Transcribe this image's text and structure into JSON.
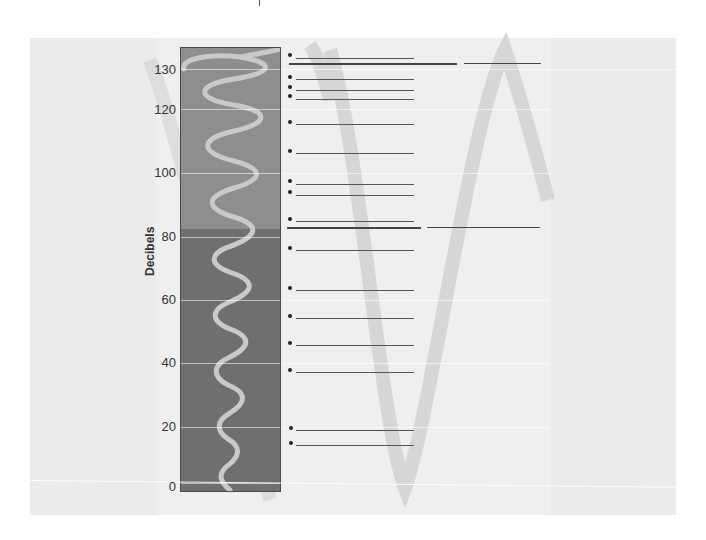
{
  "diagram": {
    "axis_title": "Decibels",
    "ticks": [
      {
        "label": "130",
        "y": 70
      },
      {
        "label": "120",
        "y": 110
      },
      {
        "label": "100",
        "y": 173
      },
      {
        "label": "80",
        "y": 237
      },
      {
        "label": "60",
        "y": 300
      },
      {
        "label": "40",
        "y": 363
      },
      {
        "label": "20",
        "y": 427
      },
      {
        "label": "0",
        "y": 487
      }
    ],
    "colors": {
      "panel": "#ebebeb",
      "column_top": "#8c8c8c",
      "column_bottom": "#6e6e6e",
      "wave": "#c8c8c8",
      "background_wave": "#d6d6d6",
      "line": "#555555"
    },
    "bullet_rows": [
      {
        "y": 55,
        "answer": ""
      },
      {
        "y": 77,
        "answer": ""
      },
      {
        "y": 86,
        "answer": ""
      },
      {
        "y": 95,
        "answer": ""
      },
      {
        "y": 121,
        "answer": ""
      },
      {
        "y": 150,
        "answer": ""
      },
      {
        "y": 180,
        "answer": ""
      },
      {
        "y": 191,
        "answer": ""
      },
      {
        "y": 218,
        "answer": ""
      },
      {
        "y": 247,
        "answer": ""
      },
      {
        "y": 287,
        "answer": ""
      },
      {
        "y": 315,
        "answer": ""
      },
      {
        "y": 342,
        "answer": ""
      },
      {
        "y": 369,
        "answer": ""
      },
      {
        "y": 428,
        "answer": ""
      },
      {
        "y": 442,
        "answer": ""
      }
    ],
    "threshold_lines": [
      {
        "name": "threshold-of-pain",
        "y": 63
      },
      {
        "name": "danger-threshold",
        "y": 228
      }
    ]
  }
}
